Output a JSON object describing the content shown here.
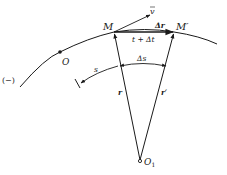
{
  "diagram": {
    "labels": {
      "point_M": "M",
      "point_M_prime": "M′",
      "origin_O": "O",
      "center_O1": "O",
      "center_O1_sub": "1",
      "velocity": "v",
      "delta_r": "Δr",
      "time_label": "t + Δt",
      "delta_s": "Δs",
      "arc_s": "s",
      "radius_r": "r",
      "radius_r_prime": "r′",
      "negative_direction": "(−)"
    },
    "colors": {
      "stroke": "#1a1a1a",
      "background": "#ffffff"
    }
  }
}
